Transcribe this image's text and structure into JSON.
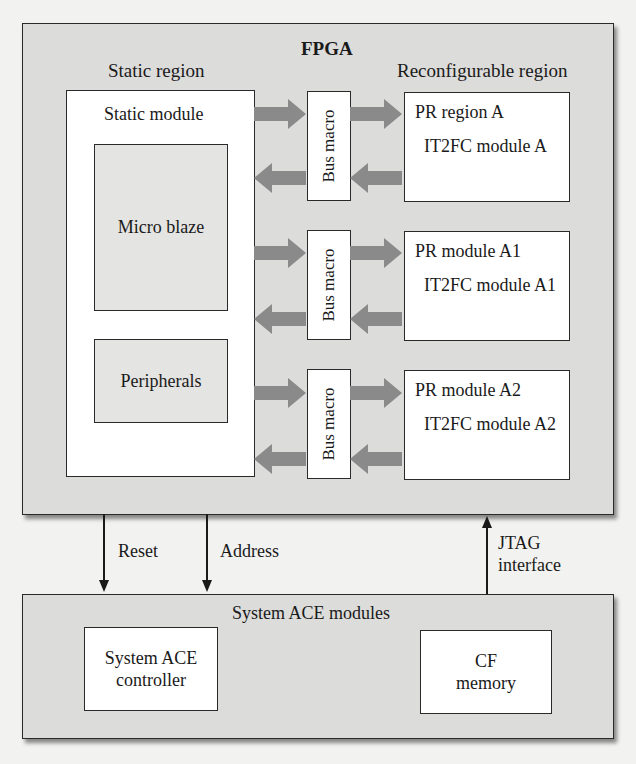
{
  "fpga": {
    "title": "FPGA",
    "static_region_label": "Static region",
    "reconfigurable_region_label": "Reconfigurable region",
    "static_module": {
      "title": "Static module",
      "micro_blaze": "Micro blaze",
      "peripherals": "Peripherals"
    },
    "bus_macros": [
      {
        "label": "Bus macro"
      },
      {
        "label": "Bus macro"
      },
      {
        "label": "Bus macro"
      }
    ],
    "pr_blocks": [
      {
        "title": "PR region A",
        "module": "IT2FC module A"
      },
      {
        "title": "PR module A1",
        "module": "IT2FC module A1"
      },
      {
        "title": "PR module A2",
        "module": "IT2FC module A2"
      }
    ]
  },
  "signals": {
    "reset": "Reset",
    "address": "Address",
    "jtag_line1": "JTAG",
    "jtag_line2": "interface"
  },
  "system_ace": {
    "title": "System ACE modules",
    "controller_line1": "System ACE",
    "controller_line2": "controller",
    "cf_line1": "CF",
    "cf_line2": "memory"
  },
  "colors": {
    "panel_fill": "#dcdcda",
    "arrow_fill": "#8a8a8a",
    "line": "#2a2a2a"
  }
}
